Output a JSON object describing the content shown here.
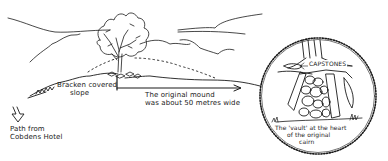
{
  "diagram": {
    "type": "hand-drawn illustration",
    "colors": {
      "ink": "#1a1a1a",
      "background": "#ffffff"
    },
    "labels": {
      "bracken": [
        "Bracken covered",
        "slope"
      ],
      "mound": [
        "The original mound",
        "was about 50 metres wide"
      ],
      "path": [
        "Path from",
        "Cobdens Hotel"
      ],
      "capstones": "CAPSTONES",
      "vault": [
        "The 'vault' at the heart",
        "of the original",
        "cairn"
      ]
    },
    "elements": {
      "tree": "tree-on-mound",
      "mound_outline": "dotted-arc",
      "dimension_arrow": "arrow-right",
      "path_arrow": "arrow-down",
      "inset": "circular-inset-vault"
    }
  }
}
